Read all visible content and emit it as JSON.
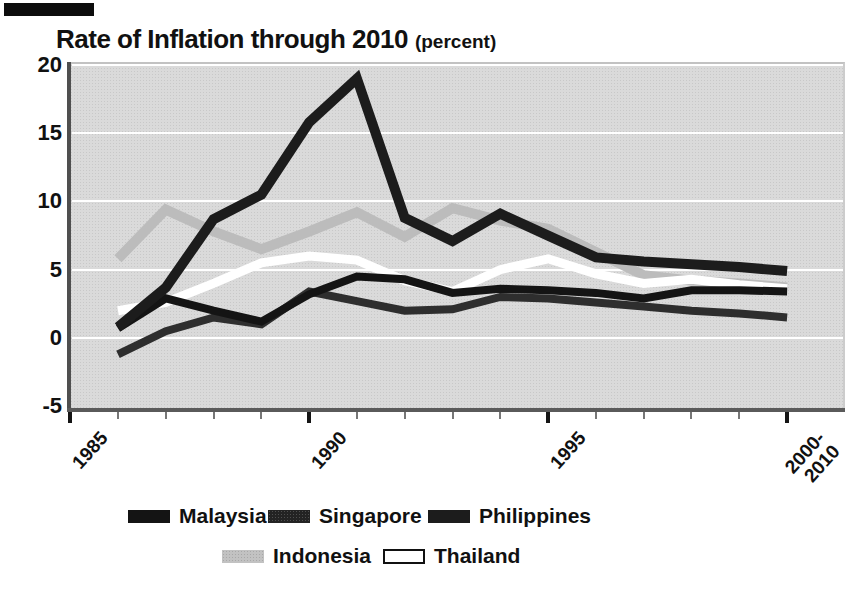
{
  "title": {
    "text": "Rate of Inflation through 2010",
    "unit": "(percent)"
  },
  "axes": {
    "y_ticks": [
      20,
      15,
      10,
      5,
      0,
      -5
    ],
    "y_gridline_values": [
      20,
      15,
      10,
      5,
      0
    ],
    "x_major_labels": [
      "1985",
      "1990",
      "1995",
      "2000-\n2010"
    ],
    "x_tick_count": 16,
    "x_major_every": 5
  },
  "legend": {
    "rows": [
      [
        {
          "label": "Malaysia",
          "series": "Malaysia",
          "swatch": "solid"
        },
        {
          "label": "Singapore",
          "series": "Singapore",
          "swatch": "tex-dark"
        },
        {
          "label": "Philippines",
          "series": "Philippines",
          "swatch": "solid"
        }
      ],
      [
        {
          "label": "Indonesia",
          "series": "Indonesia",
          "swatch": "tex-light"
        },
        {
          "label": "Thailand",
          "series": "Thailand",
          "swatch": "outlined"
        }
      ]
    ]
  },
  "chart_data": {
    "type": "line",
    "title": "Rate of Inflation through 2010",
    "ylabel": "percent",
    "ylim": [
      -5,
      20
    ],
    "grid": "white horizontal gridlines on gray plot background",
    "legend_position": "bottom",
    "x_axis_labeled_ticks": [
      "1985",
      "1990",
      "1995",
      "2000-2010"
    ],
    "categories": [
      "1986",
      "1987",
      "1988",
      "1989",
      "1990",
      "1991",
      "1992",
      "1993",
      "1994",
      "1995",
      "1996",
      "1997",
      "1998",
      "1999",
      "2000-2010"
    ],
    "series": [
      {
        "name": "Indonesia",
        "color": "#bcbcbc",
        "stroke_width": 10,
        "values": [
          5.8,
          9.4,
          7.8,
          6.5,
          7.8,
          9.2,
          7.4,
          9.5,
          8.6,
          8.0,
          6.3,
          4.6,
          4.2,
          4.0,
          3.7
        ]
      },
      {
        "name": "Thailand",
        "color": "#ffffff",
        "stroke_width": 9,
        "values": [
          2.0,
          2.6,
          4.0,
          5.5,
          6.0,
          5.7,
          4.2,
          3.4,
          5.0,
          5.8,
          4.7,
          4.0,
          4.3,
          3.9,
          3.6
        ]
      },
      {
        "name": "Singapore",
        "color": "#2e2e2e",
        "stroke_width": 8,
        "values": [
          -1.2,
          0.5,
          1.5,
          1.0,
          3.4,
          2.7,
          2.0,
          2.1,
          3.0,
          2.9,
          2.6,
          2.3,
          2.0,
          1.8,
          1.5
        ]
      },
      {
        "name": "Malaysia",
        "color": "#141414",
        "stroke_width": 8,
        "values": [
          0.7,
          2.9,
          2.0,
          1.2,
          3.2,
          4.5,
          4.3,
          3.3,
          3.6,
          3.5,
          3.3,
          2.9,
          3.5,
          3.5,
          3.4
        ]
      },
      {
        "name": "Philippines",
        "color": "#1c1c1c",
        "stroke_width": 10,
        "values": [
          0.8,
          3.7,
          8.7,
          10.5,
          15.8,
          19.0,
          8.8,
          7.1,
          9.1,
          7.5,
          5.9,
          5.6,
          5.4,
          5.2,
          4.9
        ]
      }
    ]
  }
}
